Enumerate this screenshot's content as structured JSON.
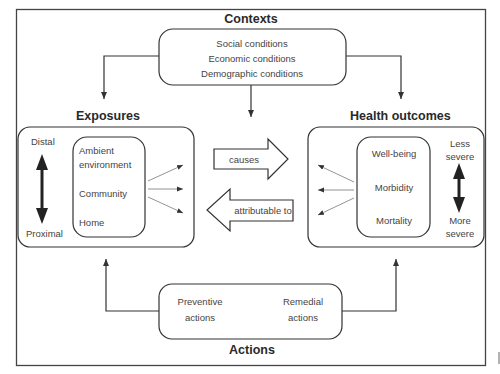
{
  "contexts": {
    "title": "Contexts",
    "items": [
      "Social conditions",
      "Economic conditions",
      "Demographic conditions"
    ]
  },
  "exposures": {
    "title": "Exposures",
    "scale_top": "Distal",
    "scale_bottom": "Proximal",
    "items": [
      "Ambient",
      "environment",
      "Community",
      "Home"
    ]
  },
  "health_outcomes": {
    "title": "Health outcomes",
    "items": [
      "Well-being",
      "Morbidity",
      "Mortality"
    ],
    "scale_top": [
      "Less",
      "severe"
    ],
    "scale_bottom": [
      "More",
      "severe"
    ]
  },
  "relations": {
    "forward": "causes",
    "backward": "attributable to"
  },
  "actions": {
    "title": "Actions",
    "preventive": [
      "Preventive",
      "actions"
    ],
    "remedial": [
      "Remedial",
      "actions"
    ]
  },
  "colors": {
    "line": "#333333",
    "text": "#444444",
    "background": "#ffffff"
  }
}
